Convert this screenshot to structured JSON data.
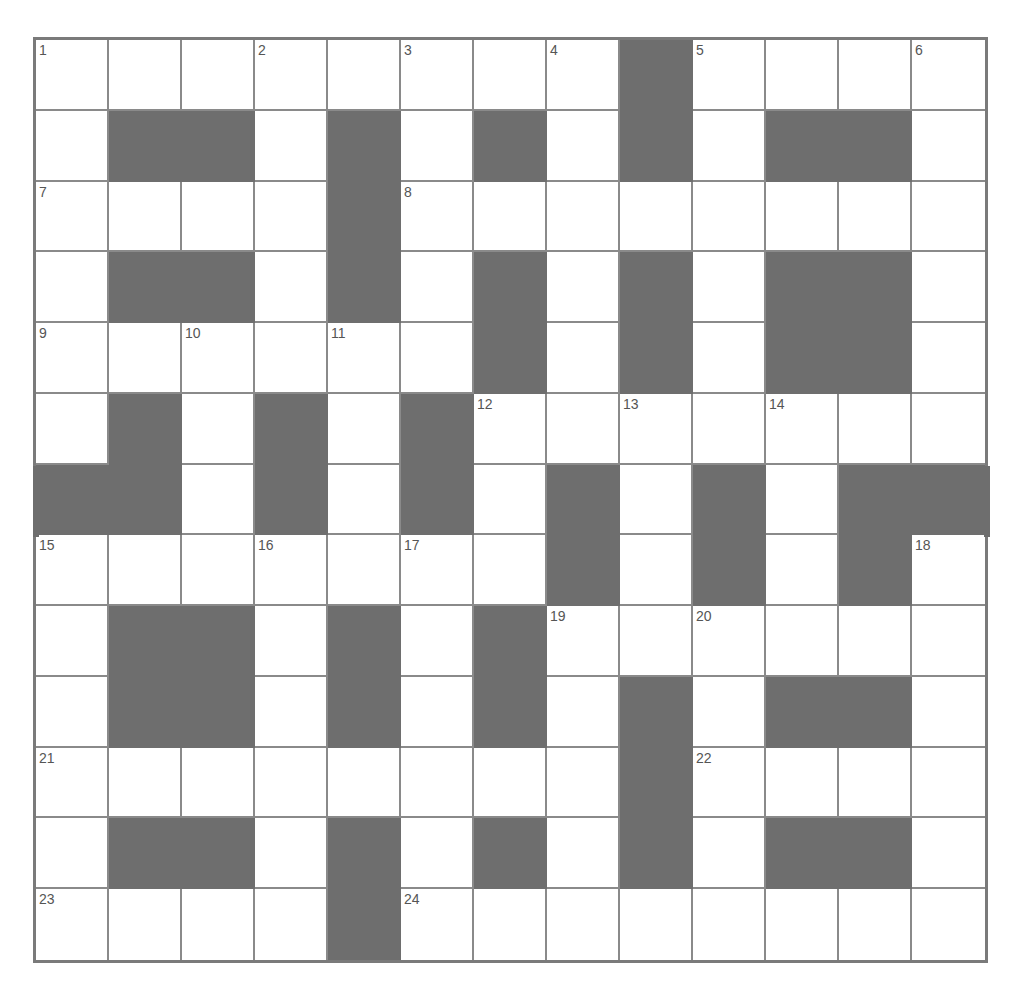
{
  "puzzle": {
    "type": "crossword",
    "rows": 13,
    "cols": 13,
    "colors": {
      "black": "#6e6e6e",
      "white": "#ffffff",
      "line": "#8a8a8a",
      "number": "#555555"
    },
    "layout": [
      "WWWWWWWWBWWWW",
      "WBBWBWBWBWBBW",
      "WWWWBWWWWWWWW",
      "WBBWBWBWBWBBW",
      "WWWWWWBWBWBBW",
      "WBWBWBWWWWWWW",
      "BBWBWBWBWBWBB",
      "WWWWWWWBWBWBW",
      "WBBWBWBWWWWWW",
      "WBBWBWBWBWBBW",
      "WWWWWWWWBWWWW",
      "WBBWBWBWBWBBW",
      "WWWWBWWWWWWWW"
    ],
    "numbers": [
      {
        "r": 0,
        "c": 0,
        "n": "1"
      },
      {
        "r": 0,
        "c": 3,
        "n": "2"
      },
      {
        "r": 0,
        "c": 5,
        "n": "3"
      },
      {
        "r": 0,
        "c": 7,
        "n": "4"
      },
      {
        "r": 0,
        "c": 9,
        "n": "5"
      },
      {
        "r": 0,
        "c": 12,
        "n": "6"
      },
      {
        "r": 2,
        "c": 0,
        "n": "7"
      },
      {
        "r": 2,
        "c": 5,
        "n": "8"
      },
      {
        "r": 4,
        "c": 0,
        "n": "9"
      },
      {
        "r": 4,
        "c": 2,
        "n": "10"
      },
      {
        "r": 4,
        "c": 4,
        "n": "11"
      },
      {
        "r": 5,
        "c": 6,
        "n": "12"
      },
      {
        "r": 5,
        "c": 8,
        "n": "13"
      },
      {
        "r": 5,
        "c": 10,
        "n": "14"
      },
      {
        "r": 7,
        "c": 0,
        "n": "15"
      },
      {
        "r": 7,
        "c": 3,
        "n": "16"
      },
      {
        "r": 7,
        "c": 5,
        "n": "17"
      },
      {
        "r": 7,
        "c": 12,
        "n": "18"
      },
      {
        "r": 8,
        "c": 7,
        "n": "19"
      },
      {
        "r": 8,
        "c": 9,
        "n": "20"
      },
      {
        "r": 10,
        "c": 0,
        "n": "21"
      },
      {
        "r": 10,
        "c": 9,
        "n": "22"
      },
      {
        "r": 12,
        "c": 0,
        "n": "23"
      },
      {
        "r": 12,
        "c": 5,
        "n": "24"
      }
    ]
  }
}
